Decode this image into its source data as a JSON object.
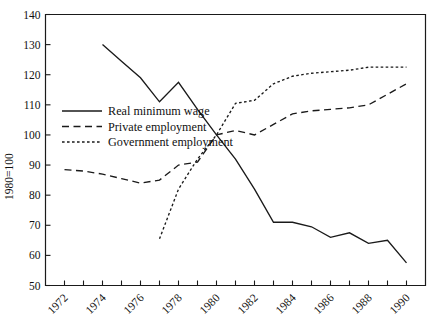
{
  "chart_data": {
    "type": "line",
    "title": "",
    "subtitle": "",
    "xlabel": "",
    "ylabel": "1980=100",
    "xlim": [
      1971,
      1991
    ],
    "ylim": [
      50,
      140
    ],
    "grid": false,
    "legend_position": "inside-left-middle",
    "y_ticks": [
      50,
      60,
      70,
      80,
      90,
      100,
      110,
      120,
      130,
      140
    ],
    "y_tick_labels": [
      "50",
      "60",
      "70",
      "80",
      "90",
      "100",
      "110",
      "120",
      "130",
      "140"
    ],
    "x_ticks": [
      1972,
      1973,
      1974,
      1975,
      1976,
      1977,
      1978,
      1979,
      1980,
      1981,
      1982,
      1983,
      1984,
      1985,
      1986,
      1987,
      1988,
      1989,
      1990
    ],
    "x_tick_labels_shown": [
      "1972",
      "1974",
      "1976",
      "1978",
      "1980",
      "1982",
      "1984",
      "1986",
      "1988",
      "1990"
    ],
    "x_tick_label_rotation": -45,
    "series": [
      {
        "name": "Real minimum wage",
        "style": "solid",
        "color": "#1a1a1a",
        "x": [
          1974,
          1975,
          1976,
          1977,
          1978,
          1979,
          1980,
          1981,
          1982,
          1983,
          1984,
          1985,
          1986,
          1987,
          1988,
          1989,
          1990
        ],
        "values": [
          130.0,
          124.5,
          119.0,
          111.0,
          117.5,
          108.5,
          100.0,
          92.0,
          82.0,
          71.0,
          71.0,
          69.5,
          66.0,
          67.5,
          64.0,
          65.0,
          57.5
        ]
      },
      {
        "name": "Private employment",
        "style": "dashed",
        "color": "#1a1a1a",
        "x": [
          1972,
          1973,
          1974,
          1975,
          1976,
          1977,
          1978,
          1979,
          1980,
          1981,
          1982,
          1983,
          1984,
          1985,
          1986,
          1987,
          1988,
          1989,
          1990
        ],
        "values": [
          88.5,
          88.0,
          87.0,
          85.5,
          84.0,
          85.0,
          90.0,
          91.0,
          100.0,
          101.5,
          100.0,
          103.5,
          107.0,
          108.0,
          108.5,
          109.0,
          110.0,
          113.5,
          117.0
        ]
      },
      {
        "name": "Government employment",
        "style": "dotted",
        "color": "#1a1a1a",
        "x": [
          1977,
          1978,
          1979,
          1980,
          1981,
          1982,
          1983,
          1984,
          1985,
          1986,
          1987,
          1988,
          1989,
          1990
        ],
        "values": [
          65.5,
          82.0,
          92.0,
          100.0,
          110.5,
          111.5,
          117.0,
          119.5,
          120.5,
          121.0,
          121.5,
          122.5,
          122.5,
          122.5
        ]
      }
    ],
    "legend_entries": [
      {
        "label": "Real minimum wage",
        "style": "solid"
      },
      {
        "label": "Private employment",
        "style": "dashed"
      },
      {
        "label": "Government employment",
        "style": "dotted"
      }
    ]
  }
}
